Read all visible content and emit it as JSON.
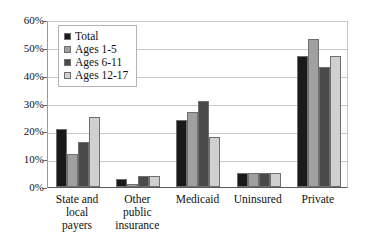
{
  "chart_data": {
    "type": "bar",
    "title": "",
    "xlabel": "",
    "ylabel": "",
    "ylim": [
      0,
      60
    ],
    "ytick_labels": [
      "0%",
      "10%",
      "20%",
      "30%",
      "40%",
      "50%",
      "60%"
    ],
    "ytick_values": [
      0,
      10,
      20,
      30,
      40,
      50,
      60
    ],
    "grid": true,
    "legend_position": "top-left-inside",
    "categories": [
      "State and local payers",
      "Other public insurance",
      "Medicaid",
      "Uninsured",
      "Private"
    ],
    "category_lines": [
      [
        "State and",
        "local",
        "payers"
      ],
      [
        "Other",
        "public",
        "insurance"
      ],
      [
        "Medicaid"
      ],
      [
        "Uninsured"
      ],
      [
        "Private"
      ]
    ],
    "series": [
      {
        "name": "Total",
        "color": "#1a1a1a",
        "values": [
          21,
          3,
          24,
          5,
          47
        ]
      },
      {
        "name": "Ages 1-5",
        "color": "#a0a0a0",
        "values": [
          12,
          1,
          27,
          5,
          53
        ]
      },
      {
        "name": "Ages 6-11",
        "color": "#4a4a4a",
        "values": [
          16,
          4,
          31,
          5,
          43
        ]
      },
      {
        "name": "Ages 12-17",
        "color": "#d0d0d0",
        "values": [
          25,
          4,
          18,
          5,
          47
        ]
      }
    ]
  },
  "legend": {
    "items": [
      {
        "label": "Total",
        "color": "#1a1a1a"
      },
      {
        "label": "Ages 1-5",
        "color": "#a0a0a0"
      },
      {
        "label": "Ages 6-11",
        "color": "#4a4a4a"
      },
      {
        "label": "Ages 12-17",
        "color": "#d0d0d0"
      }
    ]
  },
  "colors": {
    "background": "#ffffff",
    "gridline": "#c8c8c8",
    "axis": "#5a5a5a",
    "text": "#111111",
    "bar_border": "#6e6e6e"
  }
}
